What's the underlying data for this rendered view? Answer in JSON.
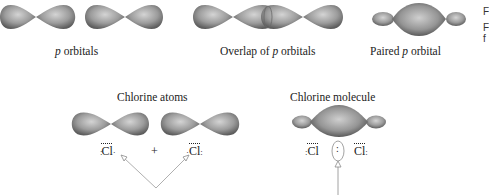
{
  "top_row": {
    "labels": {
      "p_orbitals_prefix": "p",
      "p_orbitals_suffix": " orbitals",
      "overlap_prefix": "Overlap of ",
      "overlap_italic": "p",
      "overlap_suffix": " orbitals",
      "paired_prefix": "Paired ",
      "paired_italic": "p",
      "paired_suffix": " orbital"
    }
  },
  "bottom_row": {
    "atoms_title": "Chlorine atoms",
    "molecule_title": "Chlorine molecule",
    "atom_left_symbol": "Cl",
    "atom_right_symbol": "Cl",
    "plus_sign": "+",
    "molecule_left_symbol": "Cl",
    "molecule_right_symbol": "Cl",
    "shared_pair": ":"
  },
  "side_text": {
    "line1": "F",
    "line2": "F",
    "line3": "f"
  },
  "colors": {
    "orbital_fill_center": "#c8c8c8",
    "orbital_fill_edge": "#6e6e6e",
    "arrow_line": "#9a9a9a",
    "text": "#222222"
  }
}
